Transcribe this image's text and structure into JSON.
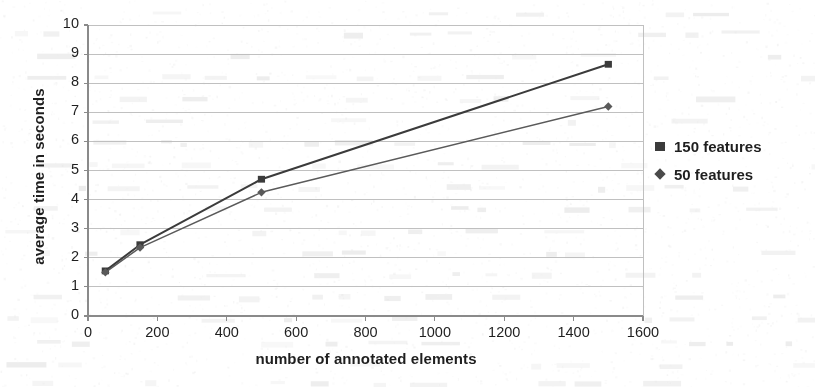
{
  "chart_data": {
    "type": "line",
    "title": "",
    "xlabel": "number of annotated elements",
    "ylabel": "average time in seconds",
    "xlim": [
      0,
      1600
    ],
    "ylim": [
      0,
      10
    ],
    "xticks": [
      0,
      200,
      400,
      600,
      800,
      1000,
      1200,
      1400,
      1600
    ],
    "yticks": [
      0,
      1,
      2,
      3,
      4,
      5,
      6,
      7,
      8,
      9,
      10
    ],
    "grid": true,
    "legend_position": "right",
    "x": [
      50,
      150,
      500,
      1500
    ],
    "series": [
      {
        "name": "150 features",
        "marker": "square",
        "color": "#3b3b3b",
        "values": [
          1.55,
          2.45,
          4.7,
          8.65
        ]
      },
      {
        "name": "50 features",
        "marker": "diamond",
        "color": "#5a5a5a",
        "values": [
          1.5,
          2.35,
          4.25,
          7.2
        ]
      }
    ]
  },
  "axes": {
    "y_title": "average time in seconds",
    "x_title": "number of annotated elements"
  },
  "legend": {
    "items": [
      {
        "label": "150 features",
        "marker": "square-marker"
      },
      {
        "label": "50 features",
        "marker": "diamond-marker"
      }
    ]
  },
  "colors": {
    "series_150": "#3b3b3b",
    "series_50": "#5a5a5a",
    "grid": "#b9b9b9",
    "axis": "#8a8a8a",
    "text": "#1f1f1f",
    "page": "#ffffff"
  }
}
